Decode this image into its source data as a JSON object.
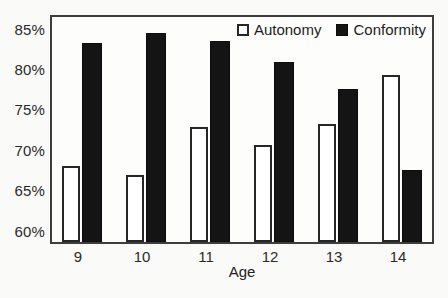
{
  "figure": {
    "kind": "scanned textbook bar chart",
    "background": "#fafaf8",
    "frame_color": "#3d3d3d"
  },
  "chart_data": {
    "type": "bar",
    "title": "",
    "categories": [
      "9",
      "10",
      "11",
      "12",
      "13",
      "14"
    ],
    "series": [
      {
        "name": "Autonomy",
        "fill": "#ffffff",
        "stroke": "#262626",
        "values": [
          68.2,
          67.0,
          72.9,
          70.7,
          73.3,
          79.4
        ]
      },
      {
        "name": "Conformity",
        "fill": "#141414",
        "stroke": "#0d0d0d",
        "values": [
          83.4,
          84.6,
          83.6,
          81.0,
          77.6,
          67.6
        ]
      }
    ],
    "xlabel": "Age",
    "ylabel": "",
    "ylim": [
      58.5,
      86.8
    ],
    "yticks": [
      60,
      65,
      70,
      75,
      80,
      85
    ],
    "ytick_suffix": "%",
    "legend_position": "top-right-inside",
    "grid": false
  }
}
